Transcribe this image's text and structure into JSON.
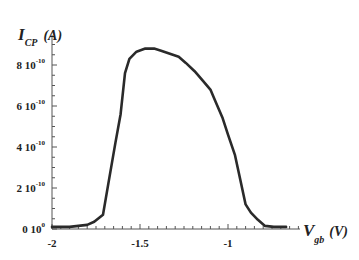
{
  "chart_data": {
    "type": "line",
    "title": "",
    "xlabel": "V_gb (V)",
    "ylabel": "I_CP (A)",
    "xlabel_main": "V",
    "xlabel_sub": "gb",
    "xlabel_unit": "(V)",
    "ylabel_main": "I",
    "ylabel_sub": "CP",
    "ylabel_unit": "(A)",
    "xlim": [
      -2.0,
      -0.59
    ],
    "ylim": [
      0,
      9.5e-10
    ],
    "grid": false,
    "legend": null,
    "x_ticks": [
      {
        "value": -2,
        "label": "-2"
      },
      {
        "value": -1.5,
        "label": "-1.5"
      },
      {
        "value": -1,
        "label": "-1"
      }
    ],
    "y_ticks": [
      {
        "value": 0,
        "mantissa": "0 10",
        "exp": "0"
      },
      {
        "value": 2e-10,
        "mantissa": "2 10",
        "exp": "-10"
      },
      {
        "value": 4e-10,
        "mantissa": "4 10",
        "exp": "-10"
      },
      {
        "value": 6e-10,
        "mantissa": "6 10",
        "exp": "-10"
      },
      {
        "value": 8e-10,
        "mantissa": "8 10",
        "exp": "-10"
      }
    ],
    "series": [
      {
        "name": "I_CP",
        "x": [
          -2.0,
          -1.9,
          -1.8,
          -1.76,
          -1.71,
          -1.68,
          -1.64,
          -1.61,
          -1.585,
          -1.56,
          -1.52,
          -1.47,
          -1.42,
          -1.38,
          -1.33,
          -1.28,
          -1.24,
          -1.19,
          -1.14,
          -1.1,
          -1.07,
          -1.03,
          -1.0,
          -0.96,
          -0.93,
          -0.9,
          -0.87,
          -0.83,
          -0.79,
          -0.74,
          -0.7,
          -0.67
        ],
        "y": [
          1e-11,
          1e-11,
          2e-11,
          3.5e-11,
          7e-11,
          2.2e-10,
          4.2e-10,
          5.6e-10,
          7.6e-10,
          8.3e-10,
          8.65e-10,
          8.8e-10,
          8.8e-10,
          8.7e-10,
          8.55e-10,
          8.4e-10,
          8.1e-10,
          7.7e-10,
          7.2e-10,
          6.8e-10,
          6.2e-10,
          5.4e-10,
          4.6e-10,
          3.6e-10,
          2.4e-10,
          1.2e-10,
          8e-11,
          4.5e-11,
          1.5e-11,
          1e-11,
          1e-11,
          1e-11
        ]
      }
    ]
  },
  "colors": {
    "line": "#2a2a2a",
    "axis": "#555555",
    "text": "#222222",
    "background": "#ffffff"
  }
}
